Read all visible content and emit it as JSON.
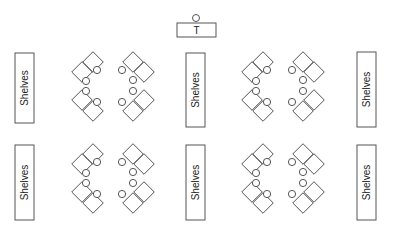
{
  "diagram": {
    "type": "classroom-floor-plan",
    "teacher_desk": {
      "label": "T",
      "x": 177,
      "y": 23,
      "w": 39,
      "h": 14,
      "chair": {
        "cx": 196,
        "cy": 18,
        "r": 3.5
      }
    },
    "shelves": [
      {
        "label": "Shelves",
        "x": 15,
        "y": 53,
        "w": 19,
        "h": 70
      },
      {
        "label": "Shelves",
        "x": 186,
        "y": 53,
        "w": 19,
        "h": 74
      },
      {
        "label": "Shelves",
        "x": 357,
        "y": 52,
        "w": 19,
        "h": 75
      },
      {
        "label": "Shelves",
        "x": 15,
        "y": 145,
        "w": 19,
        "h": 75
      },
      {
        "label": "Shelves",
        "x": 186,
        "y": 145,
        "w": 19,
        "h": 75
      },
      {
        "label": "Shelves",
        "x": 357,
        "y": 145,
        "w": 19,
        "h": 75
      }
    ],
    "desk_groups": [
      {
        "ox": 0,
        "oy": 0
      },
      {
        "ox": 170,
        "oy": 0
      },
      {
        "ox": 0,
        "oy": 92
      },
      {
        "ox": 170,
        "oy": 92
      }
    ],
    "colors": {
      "stroke": "#555555",
      "fill": "#ffffff",
      "text": "#222222"
    }
  }
}
